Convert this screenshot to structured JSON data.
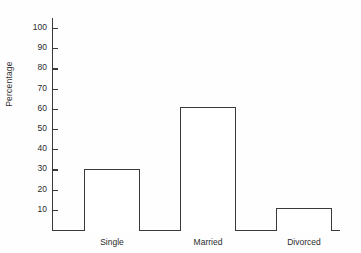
{
  "chart_data": {
    "type": "bar",
    "title": "",
    "subtitle": "",
    "xlabel": "",
    "ylabel": "Percentage",
    "categories": [
      "Single",
      "Married",
      "Divorced"
    ],
    "values": [
      30,
      61,
      11
    ],
    "ylim": [
      0,
      105
    ],
    "yticks": [
      10,
      20,
      30,
      40,
      50,
      60,
      70,
      80,
      90,
      100
    ],
    "ytick_labels": [
      "10",
      "20",
      "30",
      "40",
      "50",
      "60",
      "70",
      "80",
      "90",
      "100"
    ],
    "grid": false,
    "legend": false,
    "legend_position": "none",
    "bar_style": {
      "fill": "#ffffff",
      "outline": "#3a3a3a"
    },
    "annotations": []
  },
  "axis": {
    "y_title": "Percentage"
  }
}
